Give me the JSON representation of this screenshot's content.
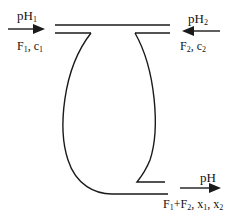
{
  "diagram": {
    "type": "mixing-vessel-schematic",
    "inlet_left": {
      "ph_label": "pH",
      "ph_sub": "1",
      "flow_label_parts": [
        "F",
        "1",
        ", c",
        "1"
      ],
      "arrow_direction": "right"
    },
    "inlet_right": {
      "ph_label": "pH",
      "ph_sub": "2",
      "flow_label_parts": [
        "F",
        "2",
        ", c",
        "2"
      ],
      "arrow_direction": "left"
    },
    "outlet": {
      "ph_label": "pH",
      "flow_label_parts": [
        "F",
        "1",
        "+F",
        "2",
        ", x",
        "1",
        ", x",
        "2"
      ],
      "arrow_direction": "right"
    },
    "colors": {
      "stroke": "#1a1a1a",
      "background": "#ffffff"
    }
  }
}
